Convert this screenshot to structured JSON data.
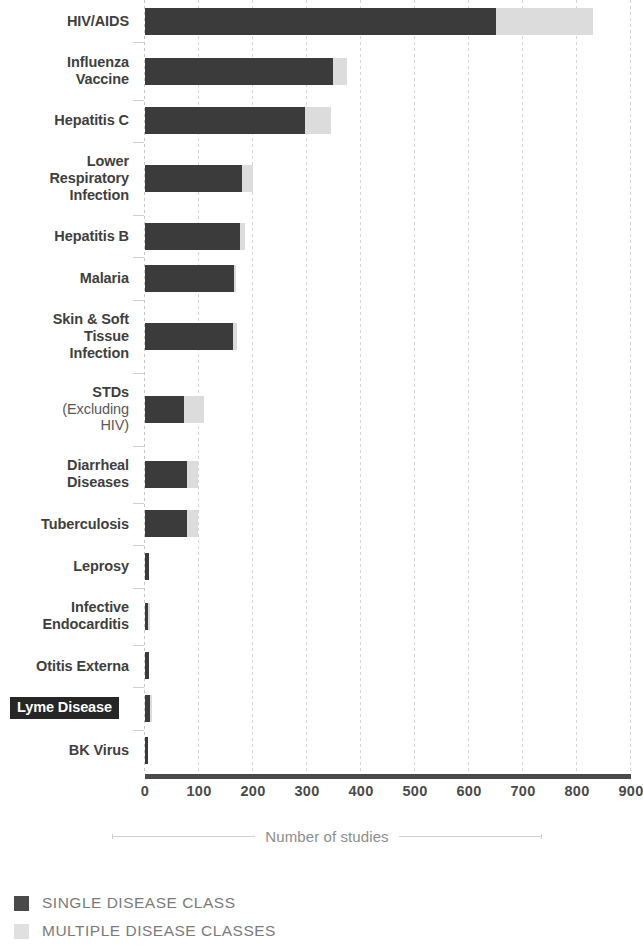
{
  "chart_data": {
    "type": "bar",
    "orientation": "horizontal",
    "stacked": true,
    "title": "",
    "xlabel": "Number of studies",
    "ylabel": "",
    "xlim": [
      0,
      900
    ],
    "xticks": [
      0,
      100,
      200,
      300,
      400,
      500,
      600,
      700,
      800,
      900
    ],
    "xtick_labels": [
      "0",
      "100",
      "200",
      "300",
      "400",
      "500",
      "600",
      "700",
      "800",
      "900"
    ],
    "grid": true,
    "legend_position": "bottom-left",
    "categories": [
      "HIV/AIDS",
      "Influenza Vaccine",
      "Hepatitis C",
      "Lower Respiratory Infection",
      "Hepatitis B",
      "Malaria",
      "Skin & Soft Tissue Infection",
      "STDs (Excluding HIV)",
      "Diarrheal Diseases",
      "Tuberculosis",
      "Leprosy",
      "Infective Endocarditis",
      "Otitis Externa",
      "Lyme Disease",
      "BK Virus"
    ],
    "series": [
      {
        "name": "SINGLE DISEASE CLASS",
        "color": "#3b3b3b",
        "values": [
          650,
          348,
          297,
          180,
          175,
          165,
          163,
          73,
          78,
          77,
          8,
          6,
          7,
          9,
          6
        ]
      },
      {
        "name": "MULTIPLE DISEASE CLASSES",
        "color": "#dcdcdc",
        "values": [
          180,
          27,
          48,
          20,
          10,
          4,
          8,
          37,
          20,
          21,
          0,
          3,
          0,
          3,
          0
        ]
      }
    ],
    "totals": [
      830,
      375,
      345,
      200,
      185,
      169,
      171,
      110,
      98,
      98,
      8,
      9,
      7,
      12,
      6
    ]
  },
  "axis": {
    "title": "Number of studies",
    "tick_labels": [
      "0",
      "100",
      "200",
      "300",
      "400",
      "500",
      "600",
      "700",
      "800",
      "900"
    ]
  },
  "categories": [
    {
      "id": "hiv-aids",
      "lines": [
        {
          "text": "HIV/AIDS",
          "bold": true
        }
      ]
    },
    {
      "id": "influenza-vaccine",
      "lines": [
        {
          "text": "Influenza",
          "bold": true
        },
        {
          "text": "Vaccine",
          "bold": true
        }
      ]
    },
    {
      "id": "hepatitis-c",
      "lines": [
        {
          "text": "Hepatitis C",
          "bold": true
        }
      ]
    },
    {
      "id": "lower-respiratory-infection",
      "lines": [
        {
          "text": "Lower",
          "bold": true
        },
        {
          "text": "Respiratory",
          "bold": true
        },
        {
          "text": "Infection",
          "bold": true
        }
      ]
    },
    {
      "id": "hepatitis-b",
      "lines": [
        {
          "text": "Hepatitis B",
          "bold": true
        }
      ]
    },
    {
      "id": "malaria",
      "lines": [
        {
          "text": "Malaria",
          "bold": true
        }
      ]
    },
    {
      "id": "skin-soft-tissue-infection",
      "lines": [
        {
          "text": "Skin & Soft",
          "bold": true
        },
        {
          "text": "Tissue",
          "bold": true
        },
        {
          "text": "Infection",
          "bold": true
        }
      ]
    },
    {
      "id": "stds-excluding-hiv",
      "lines": [
        {
          "text": "STDs",
          "bold": true
        },
        {
          "text": "(Excluding",
          "bold": false
        },
        {
          "text": "HIV)",
          "bold": false
        }
      ]
    },
    {
      "id": "diarrheal-diseases",
      "lines": [
        {
          "text": "Diarrheal",
          "bold": true
        },
        {
          "text": "Diseases",
          "bold": true
        }
      ]
    },
    {
      "id": "tuberculosis",
      "lines": [
        {
          "text": "Tuberculosis",
          "bold": true
        }
      ]
    },
    {
      "id": "leprosy",
      "lines": [
        {
          "text": "Leprosy",
          "bold": true
        }
      ]
    },
    {
      "id": "infective-endocarditis",
      "lines": [
        {
          "text": "Infective",
          "bold": true
        },
        {
          "text": "Endocarditis",
          "bold": true
        }
      ]
    },
    {
      "id": "otitis-externa",
      "lines": [
        {
          "text": "Otitis Externa",
          "bold": true
        }
      ]
    },
    {
      "id": "lyme-disease",
      "highlighted": true,
      "lines": [
        {
          "text": "Lyme Disease",
          "bold": true
        }
      ]
    },
    {
      "id": "bk-virus",
      "lines": [
        {
          "text": "BK Virus",
          "bold": true
        }
      ]
    }
  ],
  "legend": {
    "items": [
      {
        "id": "single-disease-class",
        "label": "SINGLE DISEASE CLASS",
        "color": "#4a4a4a",
        "kind": "single"
      },
      {
        "id": "multiple-disease-classes",
        "label": "MULTIPLE DISEASE CLASSES",
        "color": "#e0e0e0",
        "kind": "multi"
      }
    ]
  },
  "colors": {
    "single": "#3b3b3b",
    "multi": "#dcdcdc",
    "label_text": "#3f3f3f",
    "tick_text": "#4a4a4a",
    "axis_title_text": "#8d8d8d",
    "legend_text": "#7b7b7b",
    "grid": "#d6d6d6",
    "highlight_bg": "#262626",
    "highlight_text": "#ffffff"
  }
}
